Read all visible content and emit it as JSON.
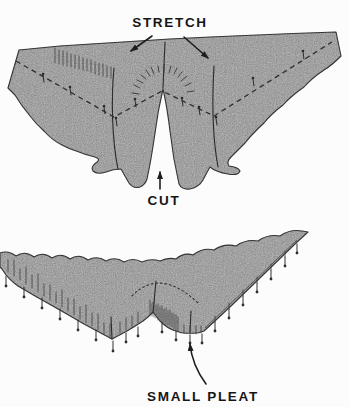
{
  "colors": {
    "background": "#fcfcfc",
    "fabric": "#b5b5b5",
    "line": "#3c3c3c",
    "text": "#151515"
  },
  "labels": {
    "stretch": "STRETCH",
    "cut": "CUT",
    "small_pleat": "SMALL PLEAT"
  }
}
